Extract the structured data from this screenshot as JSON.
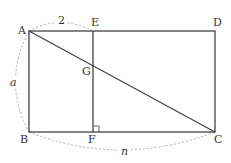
{
  "diagram": {
    "type": "geometry-figure",
    "points": {
      "A": {
        "label": "A",
        "x": 29,
        "y": 31
      },
      "E": {
        "label": "E",
        "x": 93,
        "y": 31
      },
      "D": {
        "label": "D",
        "x": 215,
        "y": 31
      },
      "B": {
        "label": "B",
        "x": 29,
        "y": 132
      },
      "F": {
        "label": "F",
        "x": 93,
        "y": 132
      },
      "C": {
        "label": "C",
        "x": 215,
        "y": 132
      },
      "G": {
        "label": "G",
        "x": 93,
        "y": 64
      }
    },
    "dimensions": {
      "AE": "2",
      "AB": "a",
      "BC": "n"
    },
    "colors": {
      "line": "#333333",
      "dashed": "#999999",
      "text": "#333333"
    }
  }
}
